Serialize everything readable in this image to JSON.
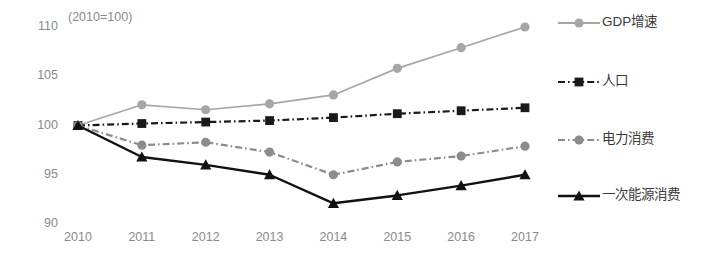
{
  "chart_data": {
    "type": "line",
    "title": "",
    "subtitle": "",
    "annotation": "(2010=100)",
    "xlabel": "",
    "ylabel": "",
    "x": [
      "2010",
      "2011",
      "2012",
      "2013",
      "2014",
      "2015",
      "2016",
      "2017"
    ],
    "categories": [
      "2010",
      "2011",
      "2012",
      "2013",
      "2014",
      "2015",
      "2016",
      "2017"
    ],
    "xlim": [
      2010,
      2017
    ],
    "ylim": [
      90,
      110
    ],
    "yticks": [
      90,
      95,
      100,
      105,
      110
    ],
    "ytick_labels": [
      "90",
      "95",
      "100",
      "105",
      "110"
    ],
    "grid": false,
    "legend_position": "right",
    "series": [
      {
        "name": "GDP增速",
        "color": "#a6a6a6",
        "marker": "circle",
        "line_style": "solid",
        "values": [
          100.0,
          102.1,
          101.6,
          102.2,
          103.1,
          105.8,
          107.9,
          110.0
        ]
      },
      {
        "name": "人口",
        "color": "#1a1a1a",
        "marker": "square",
        "line_style": "dash-dot",
        "values": [
          100.0,
          100.2,
          100.35,
          100.5,
          100.8,
          101.2,
          101.5,
          101.8
        ]
      },
      {
        "name": "电力消费",
        "color": "#8c8c8c",
        "marker": "circle",
        "line_style": "dash-dot",
        "values": [
          100.0,
          98.0,
          98.3,
          97.3,
          95.0,
          96.3,
          96.9,
          97.9
        ]
      },
      {
        "name": "一次能源消费",
        "color": "#111111",
        "marker": "triangle",
        "line_style": "solid",
        "values": [
          100.0,
          96.8,
          96.0,
          95.0,
          92.1,
          92.9,
          93.9,
          95.0
        ]
      }
    ]
  },
  "legend": {
    "items": [
      {
        "label": "GDP增速"
      },
      {
        "label": "人口"
      },
      {
        "label": "电力消费"
      },
      {
        "label": "一次能源消费"
      }
    ]
  }
}
